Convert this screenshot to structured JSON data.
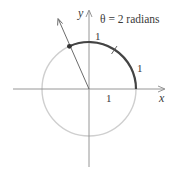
{
  "diagram": {
    "title": "θ = 2 radians",
    "axes": {
      "x_label": "x",
      "y_label": "y"
    },
    "labels": {
      "unit_x_axis": "1",
      "arc_segment_1": "1",
      "arc_segment_2": "1"
    },
    "geometry": {
      "origin": [
        89,
        89
      ],
      "radius": 47,
      "theta_radians": 2
    },
    "colors": {
      "circle": "#cfcfcf",
      "arc": "#444444",
      "axes": "#8a8a8a",
      "ray": "#5a5a5a",
      "text": "#3a3a3a"
    }
  }
}
